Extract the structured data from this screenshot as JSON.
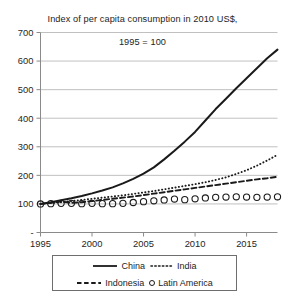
{
  "chart_data": {
    "type": "line",
    "title": "Index of per capita consumption in 2010 US$,\n1995 = 100",
    "title_line1": "Index of per capita consumption in 2010 US$,",
    "title_line2": "1995 = 100",
    "xlabel": "",
    "ylabel": "",
    "xlim": [
      1995,
      2018
    ],
    "ylim": [
      0,
      700
    ],
    "grid": "horizontal",
    "legend_position": "bottom",
    "y_ticks": [
      "-",
      "100",
      "200",
      "300",
      "400",
      "500",
      "600",
      "700"
    ],
    "y_tick_values": [
      0,
      100,
      200,
      300,
      400,
      500,
      600,
      700
    ],
    "x_ticks": [
      "1995",
      "2000",
      "2005",
      "2010",
      "2015"
    ],
    "x_tick_values": [
      1995,
      2000,
      2005,
      2010,
      2015
    ],
    "x": [
      1995,
      1996,
      1997,
      1998,
      1999,
      2000,
      2001,
      2002,
      2003,
      2004,
      2005,
      2006,
      2007,
      2008,
      2009,
      2010,
      2011,
      2012,
      2013,
      2014,
      2015,
      2016,
      2017,
      2018
    ],
    "series": [
      {
        "name": "China",
        "style": "solid",
        "color": "#1a1a1a",
        "values": [
          100,
          106,
          113,
          120,
          128,
          137,
          147,
          158,
          172,
          188,
          206,
          228,
          256,
          286,
          318,
          352,
          392,
          432,
          468,
          505,
          540,
          575,
          610,
          640
        ]
      },
      {
        "name": "India",
        "style": "dotted",
        "color": "#1a1a1a",
        "values": [
          100,
          103,
          106,
          110,
          114,
          118,
          122,
          126,
          130,
          135,
          140,
          145,
          151,
          157,
          163,
          169,
          176,
          184,
          193,
          205,
          218,
          234,
          252,
          272
        ]
      },
      {
        "name": "Indonesia",
        "style": "dashed",
        "color": "#1a1a1a",
        "values": [
          100,
          104,
          108,
          104,
          106,
          110,
          114,
          118,
          122,
          126,
          131,
          136,
          141,
          146,
          151,
          156,
          161,
          166,
          171,
          176,
          181,
          186,
          190,
          195
        ]
      },
      {
        "name": "Latin America",
        "style": "markers",
        "marker": "circle",
        "color": "#1a1a1a",
        "values": [
          100,
          101,
          102,
          102,
          101,
          102,
          101,
          101,
          102,
          105,
          108,
          111,
          114,
          117,
          115,
          118,
          121,
          123,
          124,
          125,
          124,
          123,
          124,
          125
        ]
      }
    ],
    "legend": [
      {
        "label": "China",
        "style": "solid"
      },
      {
        "label": "India",
        "style": "dotted"
      },
      {
        "label": "Indonesia",
        "style": "dashed"
      },
      {
        "label": "Latin America",
        "style": "circle-marker"
      }
    ]
  }
}
